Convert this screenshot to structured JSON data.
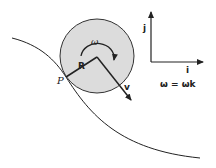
{
  "diagram": {
    "labels": {
      "omega": "ω",
      "radius": "R",
      "point": "P",
      "velocity": "v",
      "axis_i": "i",
      "axis_j": "j",
      "equation": "ω = ωk"
    },
    "colors": {
      "disk_fill": "#dcdcdc",
      "stroke": "#222222"
    }
  }
}
